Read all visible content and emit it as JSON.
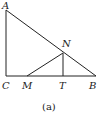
{
  "diagram": {
    "caption": "(a)",
    "points": {
      "A": {
        "label": "A",
        "x": 6,
        "y": 10
      },
      "C": {
        "label": "C",
        "x": 6,
        "y": 76
      },
      "B": {
        "label": "B",
        "x": 96,
        "y": 76
      },
      "N": {
        "label": "N",
        "x": 63,
        "y": 53
      },
      "M": {
        "label": "M",
        "x": 27,
        "y": 76
      },
      "T": {
        "label": "T",
        "x": 63,
        "y": 76
      }
    },
    "segments": [
      [
        "A",
        "C"
      ],
      [
        "C",
        "B"
      ],
      [
        "A",
        "B"
      ],
      [
        "M",
        "N"
      ],
      [
        "N",
        "T"
      ]
    ]
  }
}
